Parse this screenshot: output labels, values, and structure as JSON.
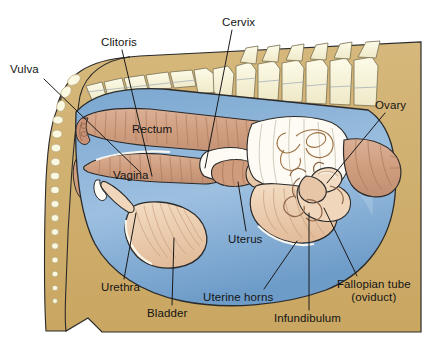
{
  "figure": {
    "type": "anatomical-diagram",
    "canvas": {
      "width": 431,
      "height": 348
    },
    "palette": {
      "background": "#ffffff",
      "body_tan": "#cdac6a",
      "body_tan_light": "#d8bd84",
      "bone_cream": "#f7f4dc",
      "bone_outline": "#b9ae7a",
      "peritoneum_blue": "#6f9dca",
      "peritoneum_blue_light": "#8fb4d8",
      "tract_pink": "#d3a183",
      "organ_peach": "#e9c6a6",
      "organ_cream": "#f2dcc3",
      "white_fill": "#fdfbf3",
      "outline": "#1a1a1a",
      "leader_line": "#1a1a1a",
      "label_text": "#141414"
    },
    "labels": [
      {
        "id": "vulva",
        "text": "Vulva",
        "x": 10,
        "y": 63,
        "leader": {
          "from": [
            44,
            79
          ],
          "to": [
            141,
            173
          ]
        }
      },
      {
        "id": "clitoris",
        "text": "Clitoris",
        "x": 101,
        "y": 36,
        "leader": {
          "from": [
            122,
            50
          ],
          "to": [
            152,
            176
          ]
        }
      },
      {
        "id": "cervix",
        "text": "Cervix",
        "x": 222,
        "y": 16,
        "leader": {
          "from": [
            232,
            30
          ],
          "to": [
            205,
            168
          ]
        }
      },
      {
        "id": "ovary",
        "text": "Ovary",
        "x": 375,
        "y": 99,
        "leader": {
          "from": [
            385,
            113
          ],
          "to": [
            327,
            183
          ]
        }
      },
      {
        "id": "rectum",
        "text": "Rectum",
        "x": 132,
        "y": 123,
        "leader": null,
        "inline": true
      },
      {
        "id": "vagina",
        "text": "Vagina",
        "x": 113,
        "y": 169,
        "leader": null,
        "inline": true
      },
      {
        "id": "uterus",
        "text": "Uterus",
        "x": 228,
        "y": 233,
        "leader": {
          "from": [
            246,
            231
          ],
          "to": [
            238,
            182
          ]
        }
      },
      {
        "id": "urethra",
        "text": "Urethra",
        "x": 101,
        "y": 281,
        "leader": {
          "from": [
            124,
            279
          ],
          "to": [
            136,
            213
          ]
        }
      },
      {
        "id": "bladder",
        "text": "Bladder",
        "x": 147,
        "y": 307,
        "leader": {
          "from": [
            172,
            305
          ],
          "to": [
            174,
            238
          ]
        }
      },
      {
        "id": "uterine-horns",
        "text": "Uterine horns",
        "x": 203,
        "y": 291,
        "leader": {
          "from": [
            264,
            289
          ],
          "to": [
            297,
            241
          ]
        }
      },
      {
        "id": "infundibulum",
        "text": "Infundibulum",
        "x": 274,
        "y": 312,
        "leader": {
          "from": [
            309,
            310
          ],
          "to": [
            309,
            213
          ]
        }
      },
      {
        "id": "fallopian-tube",
        "text": "Fallopian tube",
        "text2": "(oviduct)",
        "x": 337,
        "y": 278,
        "leader": {
          "from": [
            357,
            276
          ],
          "to": [
            324,
            208
          ]
        }
      }
    ]
  }
}
